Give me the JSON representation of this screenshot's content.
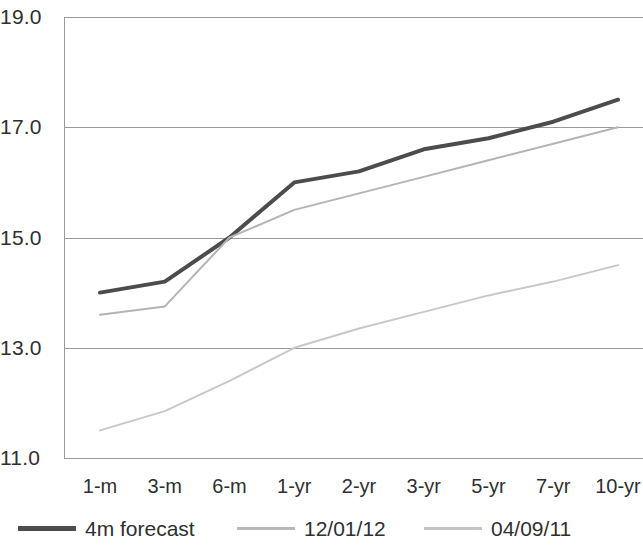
{
  "chart_data": {
    "type": "line",
    "title": "",
    "xlabel": "",
    "ylabel": "",
    "categories": [
      "1-m",
      "3-m",
      "6-m",
      "1-yr",
      "2-yr",
      "3-yr",
      "5-yr",
      "7-yr",
      "10-yr"
    ],
    "ylim": [
      11.0,
      19.0
    ],
    "y_ticks": [
      "19.0",
      "17.0",
      "15.0",
      "13.0",
      "11.0"
    ],
    "y_tick_values": [
      19.0,
      17.0,
      15.0,
      13.0,
      11.0
    ],
    "grid": true,
    "legend_position": "bottom",
    "series": [
      {
        "name": "4m forecast",
        "color": "#4c4c4c",
        "width": 4,
        "values": [
          14.0,
          14.2,
          15.0,
          16.0,
          16.2,
          16.6,
          16.8,
          17.1,
          17.5
        ]
      },
      {
        "name": "12/01/12",
        "color": "#b4b4b4",
        "width": 2,
        "values": [
          13.6,
          13.75,
          15.0,
          15.5,
          15.8,
          16.1,
          16.4,
          16.7,
          17.0
        ]
      },
      {
        "name": "04/09/11",
        "color": "#c8c8c8",
        "width": 2,
        "values": [
          11.5,
          11.85,
          12.4,
          13.0,
          13.35,
          13.65,
          13.95,
          14.2,
          14.5
        ]
      }
    ]
  },
  "axis": {
    "y_labels": [
      "19.0",
      "17.0",
      "15.0",
      "13.0",
      "11.0"
    ],
    "x_labels": [
      "1-m",
      "3-m",
      "6-m",
      "1-yr",
      "2-yr",
      "3-yr",
      "5-yr",
      "7-yr",
      "10-yr"
    ]
  },
  "legend": {
    "items": [
      {
        "label": "4m forecast",
        "color": "#4c4c4c",
        "thickness": 5
      },
      {
        "label": "12/01/12",
        "color": "#b9b9b9",
        "thickness": 3
      },
      {
        "label": "04/09/11",
        "color": "#c4c4c4",
        "thickness": 3
      }
    ]
  }
}
